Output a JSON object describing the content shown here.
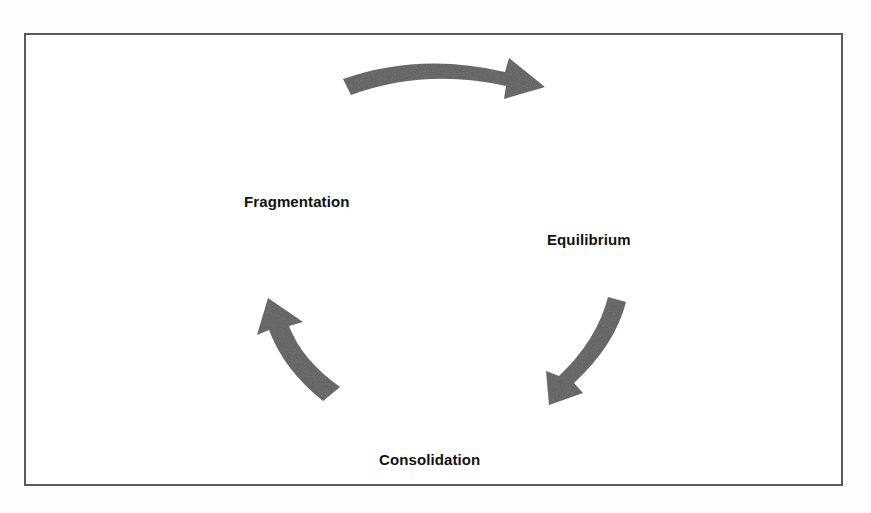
{
  "diagram": {
    "type": "cycle",
    "stages": [
      {
        "id": "fragmentation",
        "label": "Fragmentation"
      },
      {
        "id": "equilibrium",
        "label": "Equilibrium"
      },
      {
        "id": "consolidation",
        "label": "Consolidation"
      }
    ],
    "transitions": [
      {
        "from": "fragmentation",
        "to": "equilibrium",
        "icon": "curved-arrow-right-icon"
      },
      {
        "from": "equilibrium",
        "to": "consolidation",
        "icon": "curved-arrow-down-left-icon"
      },
      {
        "from": "consolidation",
        "to": "fragmentation",
        "icon": "curved-arrow-up-left-icon"
      }
    ],
    "colors": {
      "arrow": "#5c5c5c",
      "frame_border": "#5a5a5a",
      "label_text": "#111111",
      "background": "#ffffff"
    }
  }
}
